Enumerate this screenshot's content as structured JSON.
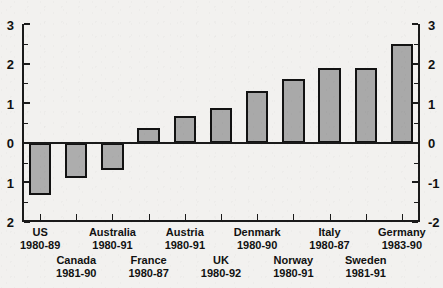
{
  "chart_data": {
    "type": "bar",
    "title": "",
    "xlabel": "",
    "ylabel": "",
    "ylim": [
      -2,
      3
    ],
    "grid": false,
    "legend": null,
    "categories": [
      "US",
      "Canada",
      "Australia",
      "France",
      "Austria",
      "UK",
      "Denmark",
      "Norway",
      "Italy",
      "Sweden",
      "Germany"
    ],
    "period_labels": [
      "1980-89",
      "1981-90",
      "1980-91",
      "1980-87",
      "1980-91",
      "1980-92",
      "1980-90",
      "1980-91",
      "1980-87",
      "1981-91",
      "1983-90"
    ],
    "values": [
      -1.33,
      -0.88,
      -0.68,
      0.38,
      0.68,
      0.88,
      1.3,
      1.6,
      1.9,
      1.9,
      2.5
    ],
    "series": [
      {
        "name": "",
        "values": [
          -1.33,
          -0.88,
          -0.68,
          0.38,
          0.68,
          0.88,
          1.3,
          1.6,
          1.9,
          1.9,
          2.5
        ]
      }
    ],
    "left_axis_ticks": [
      "3",
      "2",
      "1",
      "0",
      "1",
      "2"
    ],
    "left_axis_tick_values": [
      3,
      2,
      1,
      0,
      -1,
      -2
    ],
    "right_axis_ticks": [
      "3",
      "2",
      "1",
      "0",
      "-1",
      "-2"
    ],
    "right_axis_tick_values": [
      3,
      2,
      1,
      0,
      -1,
      -2
    ],
    "label_rows": [
      0,
      1,
      0,
      1,
      0,
      1,
      0,
      1,
      0,
      1,
      0
    ],
    "colors": {
      "bar_fill": "#a9a9a9",
      "bar_border": "#121212",
      "axis": "#1a1a1a",
      "background": "#f2f1ef",
      "text": "#111111"
    }
  }
}
